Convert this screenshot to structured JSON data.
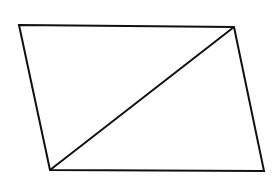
{
  "diagram": {
    "type": "parallelogram-with-diagonal",
    "stroke_color": "#111111",
    "background": "#ffffff",
    "vertices": {
      "top_left": [
        19,
        25
      ],
      "top_right": [
        234,
        27
      ],
      "bottom_right": [
        264,
        171
      ],
      "bottom_left": [
        50,
        170
      ]
    },
    "diagonal": {
      "from": "bottom_left",
      "to": "top_right"
    }
  }
}
